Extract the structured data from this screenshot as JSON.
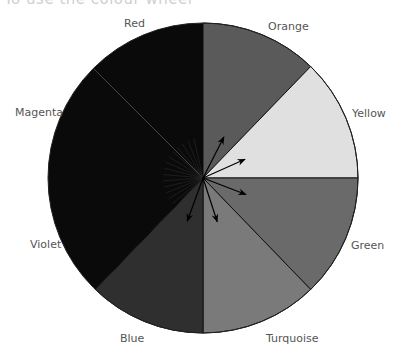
{
  "heading": {
    "text": "To use the colour wheel"
  },
  "chart_data": {
    "type": "pie",
    "title": "Colour wheel",
    "categories": [
      "Orange",
      "Yellow",
      "Green",
      "Turquoise",
      "Blue",
      "Violet",
      "Magenta",
      "Red"
    ],
    "values": [
      12.5,
      12.5,
      12.5,
      12.5,
      12.5,
      12.5,
      12.5,
      12.5
    ],
    "segment_angles_deg": [
      [
        0,
        44
      ],
      [
        44,
        90
      ],
      [
        90,
        136
      ],
      [
        136,
        180
      ],
      [
        180,
        224
      ],
      [
        224,
        270
      ],
      [
        270,
        315
      ],
      [
        315,
        360
      ]
    ],
    "grey_fills": [
      "#5a5a5a",
      "#e0e0e0",
      "#6a6a6a",
      "#7a7a7a",
      "#2f2f2f",
      "#0a0a0a",
      "#0a0a0a",
      "#0a0a0a"
    ],
    "arrows": [
      {
        "target": "Orange",
        "angle_deg": 27
      },
      {
        "target": "Yellow",
        "angle_deg": 66
      },
      {
        "target": "Green",
        "angle_deg": 111
      },
      {
        "target": "Turquoise",
        "angle_deg": 162
      },
      {
        "target": "Blue",
        "angle_deg": 200
      }
    ]
  },
  "labels": {
    "red": "Red",
    "orange": "Orange",
    "yellow": "Yellow",
    "green": "Green",
    "turquoise": "Turquoise",
    "blue": "Blue",
    "violet": "Violet",
    "magenta": "Magenta"
  }
}
